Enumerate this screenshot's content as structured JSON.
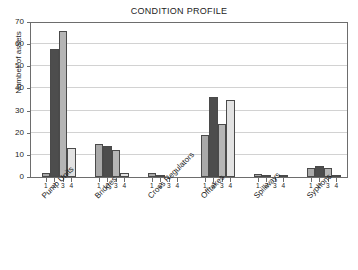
{
  "chart_data": {
    "type": "bar",
    "title": "CONDITION PROFILE",
    "xlabel": "",
    "ylabel": "Number of assets",
    "ylim": [
      0,
      70
    ],
    "ytick_values": [
      0,
      10,
      20,
      30,
      40,
      50,
      60,
      70
    ],
    "grid": true,
    "legend": "none",
    "categories": [
      "Pump Units",
      "Bridges",
      "Cross Regulators",
      "Offtakes",
      "Spillways",
      "Syphons"
    ],
    "condition_ticks": [
      "1",
      "2",
      "3",
      "4"
    ],
    "series": [
      {
        "name": "1",
        "color": "#a9a9a9",
        "values": [
          2,
          15,
          2,
          19,
          1.5,
          4
        ]
      },
      {
        "name": "2",
        "color": "#4d4d4d",
        "values": [
          58,
          14,
          1,
          36,
          0.5,
          5
        ]
      },
      {
        "name": "3",
        "color": "#b5b5b5",
        "values": [
          66,
          12,
          0,
          24,
          0,
          4
        ]
      },
      {
        "name": "4",
        "color": "#e2e2e2",
        "values": [
          13,
          2,
          0,
          35,
          0.5,
          1
        ]
      }
    ]
  },
  "axes": {
    "title": "CONDITION PROFILE",
    "ylabel": "Number of assets"
  }
}
